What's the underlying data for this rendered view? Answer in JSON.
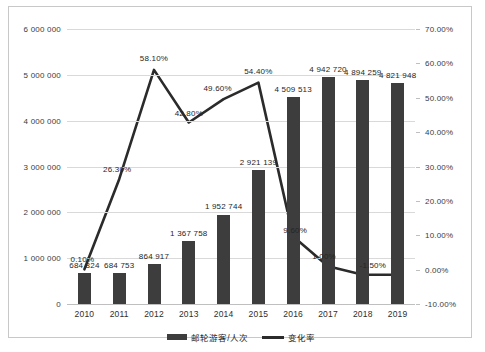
{
  "chart_data": {
    "type": "bar",
    "title": "",
    "xlabel": "",
    "ylabel": "",
    "grid": true,
    "legend_position": "bottom",
    "categories": [
      "2010",
      "2011",
      "2012",
      "2013",
      "2014",
      "2015",
      "2016",
      "2017",
      "2018",
      "2019"
    ],
    "axes": {
      "left": {
        "label": "",
        "ylim": [
          0,
          6000000
        ],
        "ticks": [
          0,
          1000000,
          2000000,
          3000000,
          4000000,
          5000000,
          6000000
        ],
        "tick_labels": [
          "0",
          "1 000 000",
          "2 000 000",
          "3 000 000",
          "4 000 000",
          "5 000 000",
          "6 000 000"
        ]
      },
      "right": {
        "label": "",
        "ylim": [
          -10,
          70
        ],
        "ticks": [
          -10,
          0,
          10,
          20,
          30,
          40,
          50,
          60,
          70
        ],
        "tick_labels": [
          "-10.00%",
          "0.00%",
          "10.00%",
          "20.00%",
          "30.00%",
          "40.00%",
          "50.00%",
          "60.00%",
          "70.00%"
        ]
      }
    },
    "series": [
      {
        "name": "邮轮游客/人次",
        "type": "bar",
        "axis": "left",
        "color": "#3d3d3d",
        "values": [
          684824,
          684753,
          864917,
          1367758,
          1952744,
          2921139,
          4509513,
          4942720,
          4894259,
          4821948
        ],
        "data_labels": [
          "684 824",
          "684 753",
          "864 917",
          "1 367 758",
          "1 952 744",
          "2 921 139",
          "4 509 513",
          "4 942 720",
          "4 894 259",
          "4 821 948"
        ]
      },
      {
        "name": "变化率",
        "type": "line",
        "axis": "right",
        "color": "#2b2b2b",
        "values": [
          0.1,
          26.3,
          58.1,
          42.8,
          49.6,
          54.4,
          9.6,
          1.0,
          -1.5,
          -1.5
        ],
        "data_labels": [
          "0.10%",
          "26.30%",
          "58.10%",
          "42.80%",
          "49.60%",
          "54.40%",
          "9.60%",
          "1.00%",
          "-1.50%",
          ""
        ]
      }
    ]
  },
  "legend": {
    "items": [
      {
        "label": "邮轮游客/人次",
        "marker": "bar-swatch"
      },
      {
        "label": "变化率",
        "marker": "line-swatch"
      }
    ]
  }
}
